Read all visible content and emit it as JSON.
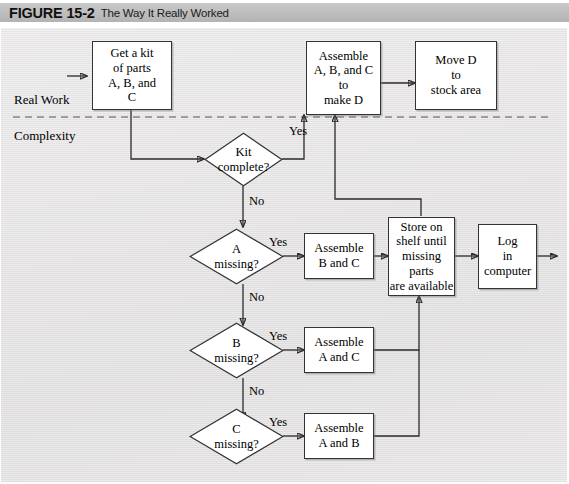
{
  "figure": {
    "label": "FIGURE 15-2",
    "title": "The Way It Really Worked"
  },
  "lanes": [
    {
      "name": "real-work",
      "label": "Real Work"
    },
    {
      "name": "complexity",
      "label": "Complexity"
    }
  ],
  "nodes": {
    "get_kit": {
      "type": "process",
      "label": "Get a kit\nof parts\nA, B, and\nC"
    },
    "assemble_abc": {
      "type": "process",
      "label": "Assemble\nA, B, and C\nto\nmake D"
    },
    "move_d": {
      "type": "process",
      "label": "Move D\nto\nstock area"
    },
    "kit_complete": {
      "type": "decision",
      "label": "Kit\ncomplete?"
    },
    "a_missing": {
      "type": "decision",
      "label": "A\nmissing?"
    },
    "b_missing": {
      "type": "decision",
      "label": "B\nmissing?"
    },
    "c_missing": {
      "type": "decision",
      "label": "C\nmissing?"
    },
    "assemble_bc": {
      "type": "process",
      "label": "Assemble\nB and C"
    },
    "assemble_ac": {
      "type": "process",
      "label": "Assemble\nA and C"
    },
    "assemble_ab": {
      "type": "process",
      "label": "Assemble\nA and B"
    },
    "store_on_shelf": {
      "type": "process",
      "label": "Store on\nshelf until\nmissing parts\nare available"
    },
    "log_computer": {
      "type": "process",
      "label": "Log\nin\ncomputer"
    }
  },
  "edge_labels": {
    "kit_yes": "Yes",
    "kit_no": "No",
    "a_yes": "Yes",
    "a_no": "No",
    "b_yes": "Yes",
    "b_no": "No",
    "c_yes": "Yes"
  },
  "colors": {
    "node_fill": "#ffffff",
    "node_stroke": "#333333",
    "line": "#2b2b2b",
    "canvas": "#e7e5e5",
    "caption_bar": "#bfbfbf"
  }
}
